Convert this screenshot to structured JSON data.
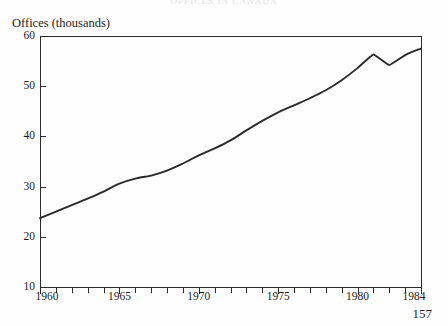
{
  "page": {
    "running_head": "OFFICES IN CANADA",
    "page_number": "157",
    "background_color": "#fefefe",
    "ink_color": "#2a2a2a"
  },
  "chart_data": {
    "type": "line",
    "title": "Offices (thousands)",
    "ylabel": "Offices  (thousands)",
    "xlabel": "",
    "xlim": [
      1960,
      1984
    ],
    "ylim": [
      10,
      60
    ],
    "ytick_labels": [
      "10",
      "20",
      "30",
      "40",
      "50",
      "60"
    ],
    "ytick_values": [
      10,
      20,
      30,
      40,
      50,
      60
    ],
    "xtick_labels": [
      "1960",
      "1965",
      "1970",
      "1975",
      "1980",
      "1984"
    ],
    "xtick_values": [
      1960,
      1965,
      1970,
      1975,
      1980,
      1984
    ],
    "minor_xticks_every": 1,
    "grid": false,
    "legend": false,
    "line_color": "#2a2a2a",
    "x": [
      1960,
      1961,
      1962,
      1963,
      1964,
      1965,
      1966,
      1967,
      1968,
      1969,
      1970,
      1971,
      1972,
      1973,
      1974,
      1975,
      1976,
      1977,
      1978,
      1979,
      1980,
      1981,
      1982,
      1983,
      1984
    ],
    "values": [
      23.7,
      25.0,
      26.3,
      27.6,
      29.0,
      30.6,
      31.6,
      32.2,
      33.2,
      34.6,
      36.2,
      37.6,
      39.2,
      41.2,
      43.1,
      44.8,
      46.2,
      47.6,
      49.2,
      51.2,
      53.6,
      56.3,
      54.2,
      56.2,
      57.5
    ],
    "series": [
      {
        "name": "Offices",
        "values": [
          23.7,
          25.0,
          26.3,
          27.6,
          29.0,
          30.6,
          31.6,
          32.2,
          33.2,
          34.6,
          36.2,
          37.6,
          39.2,
          41.2,
          43.1,
          44.8,
          46.2,
          47.6,
          49.2,
          51.2,
          53.6,
          56.3,
          54.2,
          56.2,
          57.5
        ]
      }
    ]
  }
}
